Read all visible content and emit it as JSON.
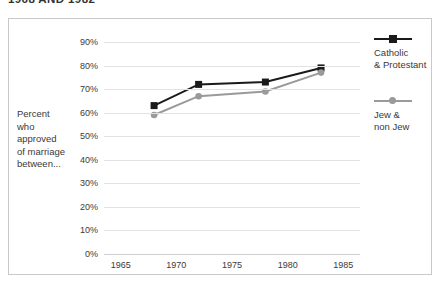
{
  "title": "1968 AND 1982",
  "axis_title_lines": [
    "Percent",
    "who",
    "approved",
    "of marriage",
    "between..."
  ],
  "legend": [
    {
      "name": "catholic-protestant",
      "marker": "square",
      "color": "#1a1a1a",
      "lines": [
        "Catholic",
        "& Protestant"
      ]
    },
    {
      "name": "jew-nonjew",
      "marker": "circle",
      "color": "#9a9a9a",
      "lines": [
        "Jew &",
        "non Jew"
      ]
    }
  ],
  "chart_data": {
    "type": "line",
    "title": "1968 AND 1982",
    "xlabel": "",
    "ylabel": "Percent who approved of marriage between...",
    "xlim": [
      1963.5,
      1986.5
    ],
    "ylim": [
      0,
      90
    ],
    "xticks": [
      1965,
      1970,
      1975,
      1980,
      1985
    ],
    "yticks": [
      0,
      10,
      20,
      30,
      40,
      50,
      60,
      70,
      80,
      90
    ],
    "ytick_labels": [
      "0%",
      "10%",
      "20%",
      "30%",
      "40%",
      "50%",
      "60%",
      "70%",
      "80%",
      "90%"
    ],
    "xtick_labels": [
      "1965",
      "1970",
      "1975",
      "1980",
      "1985"
    ],
    "grid": true,
    "legend_position": "right",
    "x": [
      1968,
      1972,
      1978,
      1983
    ],
    "series": [
      {
        "name": "Catholic & Protestant",
        "color": "#1a1a1a",
        "marker": "square",
        "values": [
          63,
          72,
          73,
          79
        ]
      },
      {
        "name": "Jew & non Jew",
        "color": "#9a9a9a",
        "marker": "circle",
        "values": [
          59,
          67,
          69,
          77
        ]
      }
    ]
  }
}
